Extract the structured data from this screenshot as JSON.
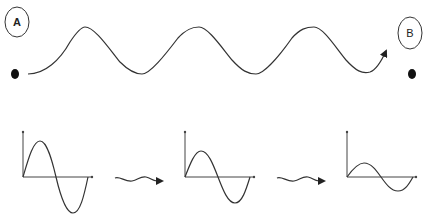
{
  "diagram": {
    "colors": {
      "line": "#333333",
      "background": "#ffffff"
    },
    "point_a": {
      "label": "A"
    },
    "point_b": {
      "label": "B"
    },
    "main_wave": {
      "cycles": 3,
      "direction": "A-to-B",
      "has_arrowhead": true
    },
    "graphs": [
      {
        "id": "graph-1",
        "amplitude_relative": 1.0
      },
      {
        "id": "graph-2",
        "amplitude_relative": 0.7
      },
      {
        "id": "graph-3",
        "amplitude_relative": 0.38
      }
    ],
    "transitions": [
      {
        "id": "wavy-arrow-1",
        "from": "graph-1",
        "to": "graph-2"
      },
      {
        "id": "wavy-arrow-2",
        "from": "graph-2",
        "to": "graph-3"
      }
    ]
  }
}
